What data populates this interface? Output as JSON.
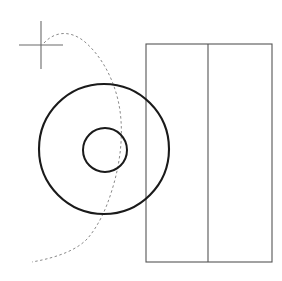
{
  "canvas": {
    "width": 282,
    "height": 281,
    "background": "#ffffff",
    "title": "Technical Drawing"
  },
  "colors": {
    "outline_dark": "#1a1a1a",
    "outline_thin": "#555555",
    "construction_gray": "#8a8a8a",
    "background": "#ffffff"
  },
  "shapes": {
    "outer_circle": {
      "name": "outer-circle",
      "cx": 104,
      "cy": 149,
      "r": 65,
      "stroke": "#1a1a1a",
      "stroke_width": 2.1,
      "fill": "none"
    },
    "inner_circle": {
      "name": "inner-circle",
      "cx": 105,
      "cy": 150,
      "r": 22,
      "stroke": "#1a1a1a",
      "stroke_width": 2.0,
      "fill": "none"
    },
    "rectangle": {
      "name": "rectangle-body",
      "x": 146,
      "y": 44,
      "width": 126,
      "height": 218,
      "stroke": "#555555",
      "stroke_width": 1.1,
      "fill": "none"
    },
    "divider_line": {
      "name": "rectangle-divider",
      "x1": 208,
      "y1": 44,
      "x2": 208,
      "y2": 262,
      "stroke": "#555555",
      "stroke_width": 1.1
    },
    "crosshair": {
      "name": "crosshair-marker",
      "cx": 41,
      "cy": 45,
      "half_horizontal": 22,
      "half_vertical": 24,
      "stroke": "#6b6b6b",
      "stroke_width": 1.1
    },
    "dashed_curve": {
      "name": "construction-curve",
      "path": "M 44 43 C 56 30 72 31 85 42 C 100 55 112 75 118 100 C 124 126 122 158 112 190 C 106 210 98 226 88 238 C 78 249 60 257 32 262",
      "stroke": "#8a8a8a",
      "stroke_width": 1.0,
      "dash_pattern": "2.5 2.5",
      "fill": "none"
    }
  },
  "labels": {
    "outer_circle": "Outer circle",
    "inner_circle": "Inner bore circle",
    "rectangle": "Rectangular block",
    "divider": "Vertical division line",
    "crosshair": "Center crosshair mark",
    "curve": "Dashed construction curve"
  }
}
